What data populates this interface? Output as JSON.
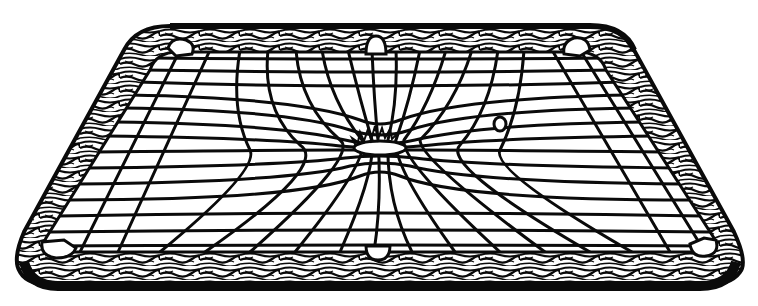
{
  "image": {
    "subject": "Billiard table with warped grid surface (gravity well analogy)",
    "style": "black-and-white line illustration",
    "colors": {
      "background": "#ffffff",
      "ink": "#0a0a0a",
      "felt": "#ffffff"
    },
    "elements": {
      "table_frame": "wood-grain rail border with rounded corners",
      "pockets": [
        "top-left",
        "top-center",
        "top-right",
        "bottom-left",
        "bottom-center",
        "bottom-right"
      ],
      "grid": "square grid lines on felt, distorted toward a central depression",
      "central_mass": "depression with spiky rim at center of table",
      "small_ball": "small ball at right of center, slightly dimpling grid"
    }
  }
}
